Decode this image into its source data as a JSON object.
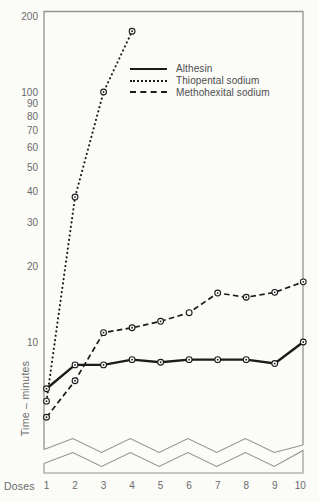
{
  "figure": {
    "ylabel": "Time – minutes",
    "xlabel": "Doses",
    "colors": {
      "data_line": "#1b1b1b",
      "frame": "#929292",
      "text": "#6a6a6a",
      "background": "#fbfbf8",
      "marker_fill": "#ffffff"
    }
  },
  "legend": {
    "items": [
      {
        "label": "Althesin",
        "style": "solid"
      },
      {
        "label": "Thiopental sodium",
        "style": "dotted"
      },
      {
        "label": "Methohexital sodium",
        "style": "dashed"
      }
    ]
  },
  "chart_data": {
    "type": "line",
    "title": "",
    "xlabel": "Doses",
    "ylabel": "Time – minutes",
    "y_scale": "log",
    "ylim": [
      4.5,
      210
    ],
    "y_ticks": [
      200,
      100,
      90,
      80,
      70,
      60,
      50,
      40,
      30,
      20,
      10
    ],
    "x_ticks": [
      1,
      2,
      3,
      4,
      5,
      6,
      7,
      8,
      9,
      10
    ],
    "axis_break_at_bottom": true,
    "grid": "off",
    "legend_position": "upper-middle-inside",
    "series": [
      {
        "name": "Althesin",
        "style": "solid",
        "doses": [
          1,
          2,
          3,
          4,
          5,
          6,
          7,
          8,
          9,
          10
        ],
        "values": [
          6.5,
          8.1,
          8.1,
          8.5,
          8.3,
          8.5,
          8.5,
          8.5,
          8.2,
          10.0
        ]
      },
      {
        "name": "Thiopental sodium",
        "style": "dotted",
        "doses": [
          1,
          2,
          3,
          4
        ],
        "values": [
          5.8,
          38,
          100,
          175
        ]
      },
      {
        "name": "Methohexital sodium",
        "style": "dashed",
        "doses": [
          1,
          2,
          3,
          4,
          5,
          6,
          7,
          8,
          9,
          10
        ],
        "values": [
          5.0,
          7.0,
          10.9,
          11.4,
          12.1,
          13.1,
          15.7,
          15.1,
          15.8,
          17.4
        ],
        "hollow_marker_doses": [
          6
        ]
      }
    ]
  }
}
